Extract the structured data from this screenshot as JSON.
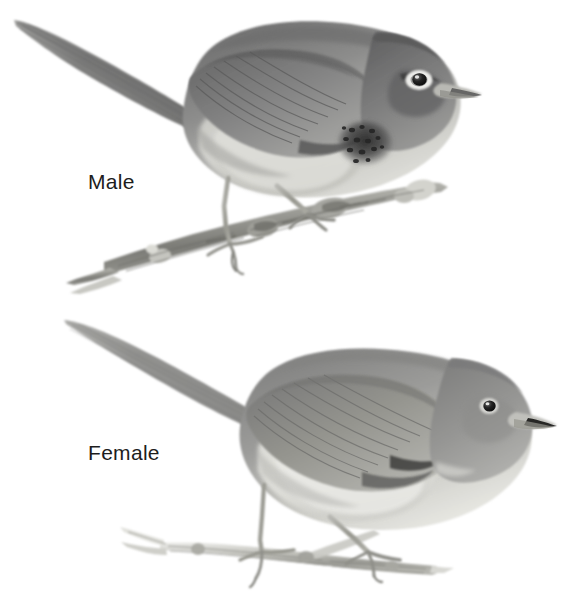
{
  "plate": {
    "medium": "graphite-pencil-illustration",
    "background_color": "#ffffff",
    "ink_color": "#4a4a4a",
    "subject": "perching songbird",
    "figures": [
      {
        "id": "male",
        "label": "Male",
        "label_position": {
          "x": 88,
          "y": 171
        },
        "pose": "perched, facing right, tail raised to upper left",
        "bounds": {
          "x": 14,
          "y": 18,
          "width": 470,
          "height": 265
        },
        "features": {
          "eye_ring": "bold white broken eye-ring (crescents above and below eye)",
          "eye_line": "dark eye-line through eye",
          "throat": "dark mottled / speckled blackish throat-and-breast patch",
          "upperparts_tone": "#8a8a8a",
          "underparts_tone": "#c9c9c6",
          "bill": "slender, pale with dark tip",
          "perch": "thick gnarled woody branch"
        }
      },
      {
        "id": "female",
        "label": "Female",
        "label_position": {
          "x": 88,
          "y": 442
        },
        "pose": "perched, leaning forward, facing right, long tail to upper left",
        "bounds": {
          "x": 62,
          "y": 318,
          "width": 497,
          "height": 272
        },
        "features": {
          "eye_ring": "faint narrow pale eye-ring",
          "eye_line": "absent",
          "throat": "plain unmarked pale throat",
          "upperparts_tone": "#939391",
          "underparts_tone": "#d2d2ce",
          "bill": "slender, pale with dark tip",
          "perch": "slim pale twig with side shoot"
        }
      }
    ]
  }
}
